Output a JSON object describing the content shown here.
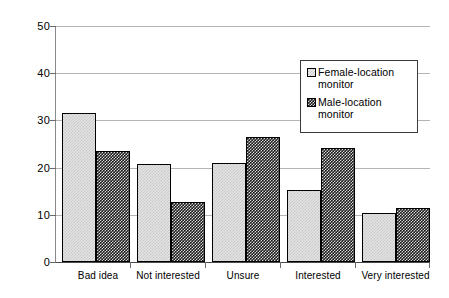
{
  "chart_data": {
    "type": "bar",
    "title": "",
    "subtitle": "",
    "xlabel": "",
    "ylabel": "",
    "categories": [
      "Bad idea",
      "Not interested",
      "Unsure",
      "Interested",
      "Very interested"
    ],
    "series": [
      {
        "name": "Female-location monitor",
        "legend_label_line1": "Female-location",
        "legend_label_line2": "monitor",
        "pattern": "light-gray checkerboard",
        "color": "#e3e3e3",
        "values": [
          31.6,
          20.8,
          21.0,
          15.3,
          10.4
        ]
      },
      {
        "name": "Male-location monitor",
        "legend_label_line1": "Male-location",
        "legend_label_line2": "monitor",
        "pattern": "dark checkerboard",
        "color": "#1c1c1c",
        "values": [
          23.5,
          12.7,
          26.5,
          24.2,
          11.4
        ]
      }
    ],
    "ylim": [
      0,
      50
    ],
    "yticks": [
      0,
      10,
      20,
      30,
      40,
      50
    ],
    "ytick_labels": [
      "0",
      "10",
      "20",
      "30",
      "40",
      "50"
    ],
    "grid": "horizontal",
    "legend_position": "upper-right-inside"
  }
}
